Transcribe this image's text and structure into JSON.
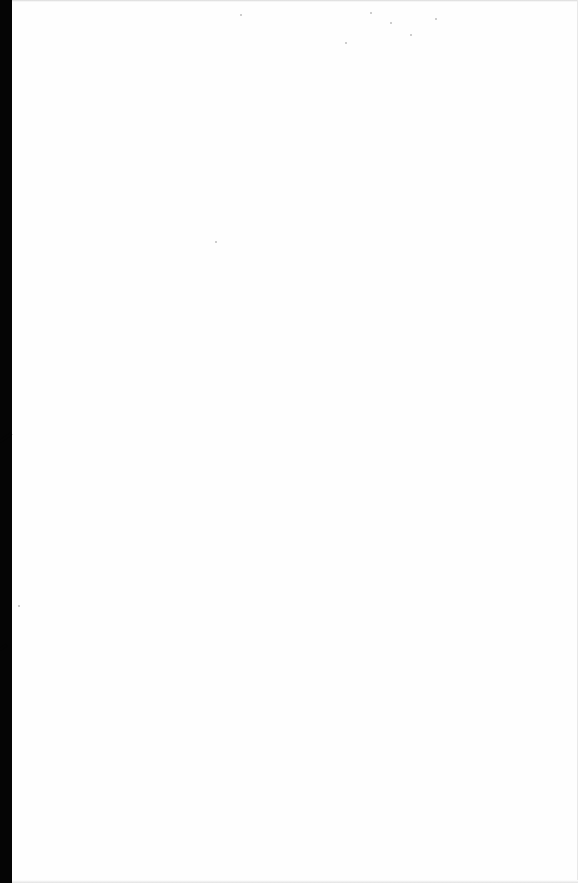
{
  "document": {
    "type": "scanned-page",
    "content": "",
    "background_color": "#fefefe",
    "edge_color": "#050505",
    "bleed_through_text": [
      "",
      ""
    ]
  }
}
